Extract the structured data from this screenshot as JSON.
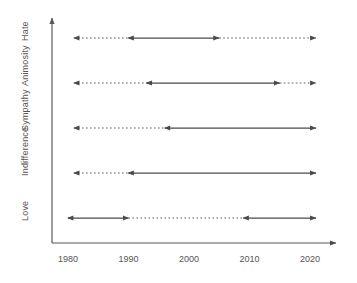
{
  "chart_data": {
    "type": "line",
    "title": "",
    "xlabel": "",
    "ylabel": "",
    "xlim": [
      1978,
      2024
    ],
    "xticks": [
      1980,
      1990,
      2000,
      2010,
      2020
    ],
    "xtick_labels": [
      "1980",
      "1990",
      "2000",
      "2010",
      "2020"
    ],
    "categories": [
      "Love",
      "Indifference",
      "Sympathy",
      "Animosity",
      "Hate"
    ],
    "grid": false,
    "legend": null,
    "axis_style": {
      "x_axis_arrow": "right",
      "y_axis_arrow": "up",
      "color": "#595959"
    },
    "series": [
      {
        "name": "Hate",
        "category": "Hate",
        "row": 4,
        "segments": [
          {
            "style": "dotted",
            "x_start": 1981,
            "x_end": 1990,
            "arrow_start": "left",
            "arrow_end": "none"
          },
          {
            "style": "solid",
            "x_start": 1990,
            "x_end": 2005,
            "arrow_start": "left",
            "arrow_end": "right"
          },
          {
            "style": "dotted",
            "x_start": 2005,
            "x_end": 2021,
            "arrow_start": "none",
            "arrow_end": "right"
          }
        ]
      },
      {
        "name": "Animosity",
        "category": "Animosity",
        "row": 3,
        "segments": [
          {
            "style": "dotted",
            "x_start": 1981,
            "x_end": 1993,
            "arrow_start": "left",
            "arrow_end": "none"
          },
          {
            "style": "solid",
            "x_start": 1993,
            "x_end": 2015,
            "arrow_start": "left",
            "arrow_end": "right"
          },
          {
            "style": "dotted",
            "x_start": 2015,
            "x_end": 2021,
            "arrow_start": "none",
            "arrow_end": "right"
          }
        ]
      },
      {
        "name": "Sympathy",
        "category": "Sympathy",
        "row": 2,
        "segments": [
          {
            "style": "dotted",
            "x_start": 1981,
            "x_end": 1996,
            "arrow_start": "left",
            "arrow_end": "none"
          },
          {
            "style": "solid",
            "x_start": 1996,
            "x_end": 2021,
            "arrow_start": "left",
            "arrow_end": "right"
          }
        ]
      },
      {
        "name": "Indifference",
        "category": "Indifference",
        "row": 1,
        "segments": [
          {
            "style": "dotted",
            "x_start": 1981,
            "x_end": 1990,
            "arrow_start": "left",
            "arrow_end": "none"
          },
          {
            "style": "solid",
            "x_start": 1990,
            "x_end": 2021,
            "arrow_start": "left",
            "arrow_end": "right"
          }
        ]
      },
      {
        "name": "Love",
        "category": "Love",
        "row": 0,
        "segments": [
          {
            "style": "solid",
            "x_start": 1980,
            "x_end": 1990,
            "arrow_start": "left",
            "arrow_end": "right"
          },
          {
            "style": "dotted",
            "x_start": 1990,
            "x_end": 2009,
            "arrow_start": "none",
            "arrow_end": "none"
          },
          {
            "style": "solid",
            "x_start": 2009,
            "x_end": 2021,
            "arrow_start": "left",
            "arrow_end": "right"
          }
        ]
      }
    ]
  }
}
